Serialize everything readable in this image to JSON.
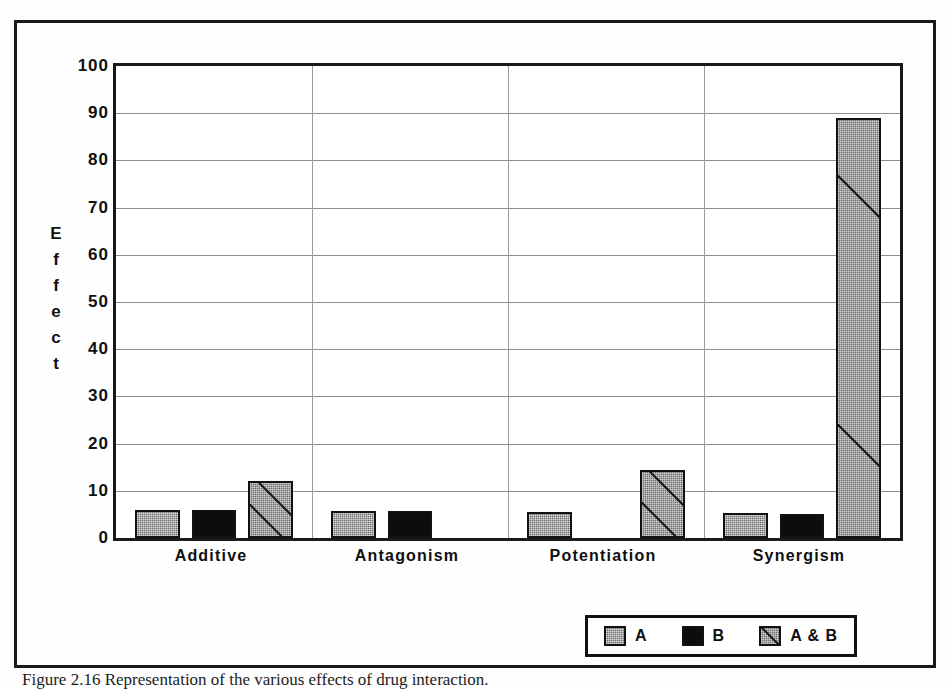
{
  "figure": {
    "caption": "Figure 2.16  Representation of the various effects of drug interaction."
  },
  "chart_data": {
    "type": "bar",
    "title": "",
    "xlabel": "",
    "ylabel": "Effect",
    "ylim": [
      0,
      100
    ],
    "ytick_step": 10,
    "yticks": [
      100,
      90,
      80,
      70,
      60,
      50,
      40,
      30,
      20,
      10,
      0
    ],
    "grid": "horizontal-and-vertical-category-separators",
    "legend_position": "bottom-right",
    "categories": [
      "Additive",
      "Antagonism",
      "Potentiation",
      "Synergism"
    ],
    "series": [
      {
        "name": "A",
        "key": "series-a",
        "values": [
          6,
          5.8,
          5.5,
          5.2
        ]
      },
      {
        "name": "B",
        "key": "series-b",
        "values": [
          6,
          5.8,
          0,
          5.1
        ]
      },
      {
        "name": "A & B",
        "key": "series-ab",
        "values": [
          12,
          0,
          14.5,
          89
        ]
      }
    ],
    "colors": {
      "series_a": "#6e6e6e",
      "series_b": "#0d0d0d",
      "series_ab": "#6e6e6e",
      "axis": "#1a1a1a",
      "gridline": "#8e8e8e",
      "plot_background": "#ffffff"
    }
  },
  "axis": {
    "y_title_letters": [
      "E",
      "f",
      "f",
      "e",
      "c",
      "t"
    ]
  },
  "legend": {
    "items": [
      {
        "label": "A",
        "key": "series-a"
      },
      {
        "label": "B",
        "key": "series-b"
      },
      {
        "label": "A & B",
        "key": "series-ab"
      }
    ]
  }
}
